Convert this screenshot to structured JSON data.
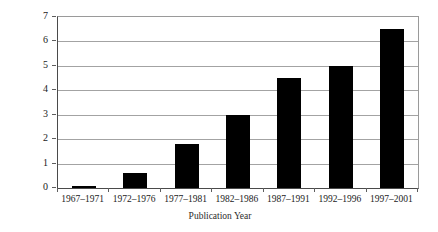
{
  "chart_data": {
    "type": "bar",
    "title": "",
    "xlabel": "Publication Year",
    "ylabel": "% Risk Articles",
    "categories": [
      "1967–1971",
      "1972–1976",
      "1977–1981",
      "1982–1986",
      "1987–1991",
      "1992–1996",
      "1997–2001"
    ],
    "values": [
      0.1,
      0.6,
      1.8,
      3.0,
      4.5,
      5.0,
      6.5
    ],
    "ylim": [
      0,
      7
    ],
    "yticks": [
      "0",
      "1",
      "2",
      "3",
      "4",
      "5",
      "6",
      "7"
    ],
    "ytick_values": [
      0,
      1,
      2,
      3,
      4,
      5,
      6,
      7
    ],
    "grid": "horizontal",
    "legend": "none",
    "bar_color": "#000000",
    "gridline_color": "#a3a3a3",
    "axis_color": "#4a4a4a"
  }
}
